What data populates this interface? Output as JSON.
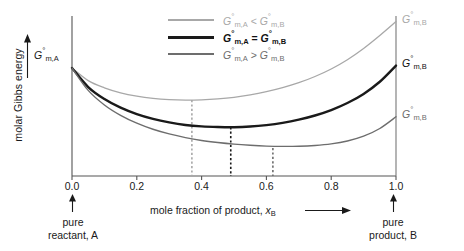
{
  "axes": {
    "y_label": "molar Gibbs energy",
    "x_label_prefix": "mole fraction of product, ",
    "x_label_symbol": "x",
    "x_label_sub": "B",
    "x_ticks": [
      "0.0",
      "0.2",
      "0.4",
      "0.6",
      "0.8",
      "1.0"
    ]
  },
  "curve_labels": {
    "left_intercept": "G",
    "left_intercept_sub": "m,A",
    "right_high": "G",
    "right_high_sub": "m,B",
    "right_mid": "G",
    "right_mid_sub": "m,B",
    "right_low": "G",
    "right_low_sub": "m,B"
  },
  "legend": {
    "items": [
      {
        "symbol_a": "G",
        "sub_a": "m,A",
        "relation": "<",
        "symbol_b": "G",
        "sub_b": "m,B",
        "color": "#a8a8a8"
      },
      {
        "symbol_a": "G",
        "sub_a": "m,A",
        "relation": "=",
        "symbol_b": "G",
        "sub_b": "m,B",
        "color": "#1a1a1a"
      },
      {
        "symbol_a": "G",
        "sub_a": "m,A",
        "relation": ">",
        "symbol_b": "G",
        "sub_b": "m,B",
        "color": "#6d6d6d"
      }
    ]
  },
  "annotations": {
    "left_line1": "pure",
    "left_line2": "reactant, A",
    "right_line1": "pure",
    "right_line2": "product, B"
  },
  "chart_data": {
    "type": "line",
    "title": "",
    "xlabel": "mole fraction of product, x_B",
    "ylabel": "molar Gibbs energy",
    "xlim": [
      0.0,
      1.0
    ],
    "ylim": [
      0.0,
      1.0
    ],
    "grid": false,
    "legend_position": "top-center",
    "x_ticks": [
      0.0,
      0.2,
      0.4,
      0.6,
      0.8,
      1.0
    ],
    "y_ticks": [],
    "series": [
      {
        "name": "G°m,A < G°m,B",
        "color": "#a8a8a8",
        "linewidth": 1.3,
        "start_value": 0.675,
        "end_value": 0.965,
        "minimum": {
          "x": 0.37,
          "y": 0.475
        },
        "x": [
          0.0,
          0.05,
          0.1,
          0.15,
          0.2,
          0.25,
          0.3,
          0.35,
          0.4,
          0.45,
          0.5,
          0.55,
          0.6,
          0.65,
          0.7,
          0.75,
          0.8,
          0.85,
          0.9,
          0.95,
          1.0
        ],
        "y": [
          0.675,
          0.596,
          0.551,
          0.52,
          0.499,
          0.485,
          0.477,
          0.474,
          0.476,
          0.482,
          0.492,
          0.507,
          0.527,
          0.552,
          0.583,
          0.622,
          0.669,
          0.727,
          0.797,
          0.878,
          0.965
        ]
      },
      {
        "name": "G°m,A = G°m,B",
        "color": "#1a1a1a",
        "linewidth": 2.4,
        "start_value": 0.675,
        "end_value": 0.69,
        "minimum": {
          "x": 0.49,
          "y": 0.305
        },
        "x": [
          0.0,
          0.05,
          0.1,
          0.15,
          0.2,
          0.25,
          0.3,
          0.35,
          0.4,
          0.45,
          0.5,
          0.55,
          0.6,
          0.65,
          0.7,
          0.75,
          0.8,
          0.85,
          0.9,
          0.95,
          1.0
        ],
        "y": [
          0.675,
          0.556,
          0.481,
          0.427,
          0.387,
          0.357,
          0.335,
          0.319,
          0.31,
          0.306,
          0.305,
          0.309,
          0.318,
          0.332,
          0.352,
          0.378,
          0.412,
          0.456,
          0.513,
          0.589,
          0.69
        ]
      },
      {
        "name": "G°m,A > G°m,B",
        "color": "#6d6d6d",
        "linewidth": 1.4,
        "start_value": 0.675,
        "end_value": 0.37,
        "minimum": {
          "x": 0.62,
          "y": 0.175
        },
        "x": [
          0.0,
          0.05,
          0.1,
          0.15,
          0.2,
          0.25,
          0.3,
          0.35,
          0.4,
          0.45,
          0.5,
          0.55,
          0.6,
          0.65,
          0.7,
          0.75,
          0.8,
          0.85,
          0.9,
          0.95,
          1.0
        ],
        "y": [
          0.675,
          0.535,
          0.444,
          0.379,
          0.33,
          0.292,
          0.263,
          0.24,
          0.222,
          0.209,
          0.199,
          0.192,
          0.187,
          0.185,
          0.186,
          0.191,
          0.201,
          0.219,
          0.249,
          0.297,
          0.37
        ]
      }
    ],
    "drop_lines": [
      {
        "x": 0.37,
        "color": "#a8a8a8",
        "from_series": "G°m,A < G°m,B"
      },
      {
        "x": 0.49,
        "color": "#1a1a1a",
        "from_series": "G°m,A = G°m,B"
      },
      {
        "x": 0.62,
        "color": "#6d6d6d",
        "from_series": "G°m,A > G°m,B"
      }
    ]
  }
}
